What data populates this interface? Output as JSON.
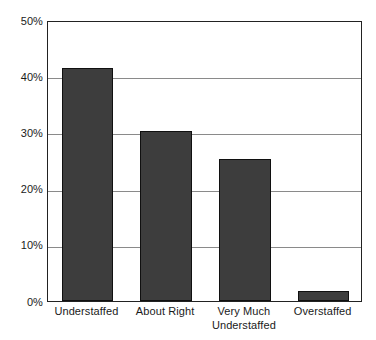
{
  "chart_data": {
    "type": "bar",
    "title": "",
    "subtitle": "",
    "xlabel": "",
    "ylabel": "",
    "categories": [
      "Understaffed",
      "About Right",
      "Very Much Understaffed",
      "Overstaffed"
    ],
    "category_lines": [
      [
        "Understaffed"
      ],
      [
        "About Right"
      ],
      [
        "Very Much",
        "Understaffed"
      ],
      [
        "Overstaffed"
      ]
    ],
    "values": [
      41.5,
      30.2,
      25.3,
      1.7
    ],
    "value_unit": "%",
    "ylim": [
      0,
      50
    ],
    "ytick_values": [
      0,
      10,
      20,
      30,
      40,
      50
    ],
    "ytick_labels": [
      "0%",
      "10%",
      "20%",
      "30%",
      "40%",
      "50%"
    ],
    "grid": true,
    "grid_axis": "y",
    "legend": false,
    "legend_position": "none",
    "bar_color": "#3d3d3d",
    "bar_border_color": "#101010",
    "gridline_color": "#8a8a8a",
    "frame_color": "#222222",
    "background_color": "#ffffff",
    "text_color": "#1a1a1a"
  }
}
